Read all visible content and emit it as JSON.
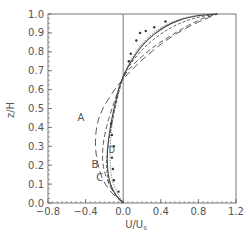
{
  "chart_data": {
    "type": "line",
    "title": "",
    "xlabel": "U/U",
    "xlabel_subscript": "s",
    "ylabel": "z/H",
    "xlim": [
      -0.8,
      1.2
    ],
    "ylim": [
      0.0,
      1.0
    ],
    "xticks": [
      "-0.8",
      "-0.4",
      "0.0",
      "0.4",
      "0.8",
      "1.2"
    ],
    "yticks": [
      "0.0",
      "0.1",
      "0.2",
      "0.3",
      "0.4",
      "0.5",
      "0.6",
      "0.7",
      "0.8",
      "0.9",
      "1.0"
    ],
    "grid": false,
    "zero_line": 0.0,
    "series": [
      {
        "name": "A",
        "style": "long-dash",
        "label_at": [
          -0.45,
          0.45
        ],
        "points": [
          [
            0.0,
            0.0
          ],
          [
            -0.12,
            0.05
          ],
          [
            -0.22,
            0.12
          ],
          [
            -0.28,
            0.22
          ],
          [
            -0.3,
            0.32
          ],
          [
            -0.28,
            0.42
          ],
          [
            -0.22,
            0.5
          ],
          [
            -0.12,
            0.58
          ],
          [
            -0.03,
            0.64
          ],
          [
            0.08,
            0.7
          ],
          [
            0.25,
            0.78
          ],
          [
            0.45,
            0.86
          ],
          [
            0.68,
            0.93
          ],
          [
            0.9,
            0.98
          ],
          [
            1.0,
            1.0
          ]
        ]
      },
      {
        "name": "B",
        "style": "medium-dash",
        "label_at": [
          -0.3,
          0.2
        ],
        "points": [
          [
            0.0,
            0.0
          ],
          [
            -0.1,
            0.05
          ],
          [
            -0.17,
            0.12
          ],
          [
            -0.22,
            0.2
          ],
          [
            -0.22,
            0.3
          ],
          [
            -0.18,
            0.4
          ],
          [
            -0.12,
            0.5
          ],
          [
            -0.05,
            0.6
          ],
          [
            0.0,
            0.67
          ],
          [
            0.1,
            0.73
          ],
          [
            0.3,
            0.82
          ],
          [
            0.55,
            0.9
          ],
          [
            0.8,
            0.97
          ],
          [
            1.0,
            1.0
          ]
        ]
      },
      {
        "name": "C",
        "style": "short-dash",
        "label_at": [
          -0.25,
          0.13
        ],
        "points": [
          [
            0.0,
            0.0
          ],
          [
            -0.08,
            0.04
          ],
          [
            -0.15,
            0.1
          ],
          [
            -0.18,
            0.18
          ],
          [
            -0.17,
            0.28
          ],
          [
            -0.13,
            0.4
          ],
          [
            -0.08,
            0.52
          ],
          [
            -0.03,
            0.62
          ],
          [
            0.0,
            0.67
          ],
          [
            0.08,
            0.74
          ],
          [
            0.25,
            0.84
          ],
          [
            0.5,
            0.93
          ],
          [
            0.75,
            0.98
          ],
          [
            1.0,
            1.0
          ]
        ]
      },
      {
        "name": "D",
        "style": "dotted",
        "label_at": [
          -0.12,
          0.28
        ],
        "points": [
          [
            0.0,
            0.0
          ],
          [
            -0.06,
            0.05
          ],
          [
            -0.12,
            0.12
          ],
          [
            -0.14,
            0.2
          ],
          [
            -0.14,
            0.3
          ],
          [
            -0.12,
            0.42
          ],
          [
            -0.08,
            0.52
          ],
          [
            -0.03,
            0.62
          ],
          [
            0.0,
            0.67
          ],
          [
            0.06,
            0.74
          ],
          [
            0.2,
            0.85
          ],
          [
            0.42,
            0.94
          ],
          [
            0.7,
            0.99
          ],
          [
            1.0,
            1.0
          ]
        ]
      },
      {
        "name": "solid",
        "style": "solid",
        "points": [
          [
            0.0,
            0.0
          ],
          [
            -0.08,
            0.04
          ],
          [
            -0.14,
            0.1
          ],
          [
            -0.17,
            0.18
          ],
          [
            -0.17,
            0.28
          ],
          [
            -0.14,
            0.4
          ],
          [
            -0.09,
            0.52
          ],
          [
            -0.04,
            0.62
          ],
          [
            0.0,
            0.67
          ],
          [
            0.07,
            0.74
          ],
          [
            0.22,
            0.85
          ],
          [
            0.45,
            0.94
          ],
          [
            0.72,
            0.99
          ],
          [
            1.0,
            1.0
          ]
        ]
      },
      {
        "name": "measured",
        "style": "markers",
        "points": [
          [
            -0.13,
            0.42
          ],
          [
            -0.12,
            0.36
          ],
          [
            -0.1,
            0.3
          ],
          [
            -0.12,
            0.24
          ],
          [
            -0.11,
            0.18
          ],
          [
            -0.1,
            0.12
          ],
          [
            -0.05,
            0.06
          ],
          [
            0.06,
            0.75
          ],
          [
            0.08,
            0.79
          ],
          [
            0.14,
            0.86
          ],
          [
            0.18,
            0.9
          ],
          [
            0.24,
            0.91
          ],
          [
            0.33,
            0.93
          ],
          [
            0.45,
            0.96
          ]
        ]
      }
    ]
  }
}
